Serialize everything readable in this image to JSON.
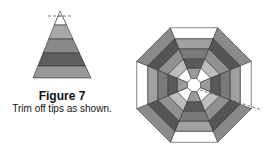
{
  "figure": {
    "title": "Figure 7",
    "subtitle": "Trim off tips as shown."
  },
  "triangle": {
    "apex": [
      60,
      11
    ],
    "base_y": 78,
    "base_left": 33,
    "base_right": 91,
    "trim_line_y": 16,
    "bands": [
      {
        "y0": 16,
        "y1": 25,
        "color": "#ffffff"
      },
      {
        "y0": 25,
        "y1": 39,
        "color": "#a8a8a8"
      },
      {
        "y0": 39,
        "y1": 53,
        "color": "#8a8a8a"
      },
      {
        "y0": 53,
        "y1": 66,
        "color": "#5e5e5e"
      },
      {
        "y0": 66,
        "y1": 78,
        "color": "#979797"
      }
    ]
  },
  "octagon": {
    "center": [
      194,
      85
    ],
    "rings": [
      {
        "r": 62,
        "colors": [
          "#8a8a8a",
          "#ffffff"
        ]
      },
      {
        "r": 50,
        "colors": [
          "#555555",
          "#a0a0a0"
        ]
      },
      {
        "r": 39,
        "colors": [
          "#909090",
          "#7a7a7a"
        ]
      },
      {
        "r": 28,
        "colors": [
          "#bdbdbd",
          "#5a5a5a"
        ]
      },
      {
        "r": 18,
        "colors": [
          "#ffffff",
          "#9a9a9a"
        ]
      },
      {
        "r": 7,
        "colors": [
          "#ffffff",
          "#ffffff"
        ]
      }
    ],
    "trim_line": {
      "x1": 200,
      "y1": 90,
      "x2": 262,
      "y2": 110
    }
  },
  "colors": {
    "stroke": "#333333",
    "dash": "#555555"
  }
}
